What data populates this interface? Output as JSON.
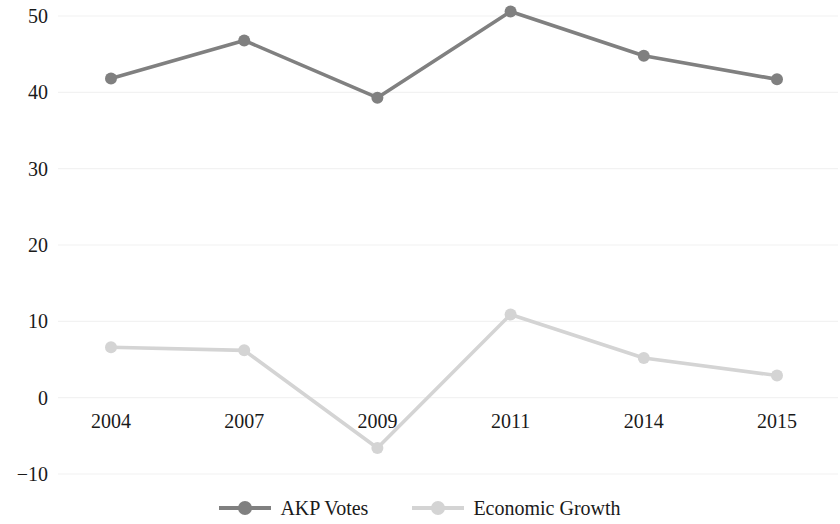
{
  "chart_data": {
    "type": "line",
    "title": "",
    "xlabel": "",
    "ylabel": "",
    "categories": [
      "2004",
      "2007",
      "2009",
      "2011",
      "2014",
      "2015"
    ],
    "series": [
      {
        "name": "AKP Votes",
        "color": "#808080",
        "values": [
          41.8,
          46.8,
          39.3,
          50.6,
          44.8,
          41.7
        ]
      },
      {
        "name": "Economic Growth",
        "color": "#d4d4d4",
        "values": [
          6.6,
          6.2,
          -6.6,
          10.9,
          5.2,
          2.9
        ]
      }
    ],
    "ylim": [
      -10,
      50
    ],
    "yticks": [
      50,
      40,
      30,
      20,
      10,
      0,
      -10
    ],
    "ytick_labels": [
      "50",
      "40",
      "30",
      "20",
      "10",
      "0",
      "−10"
    ],
    "grid": true,
    "grid_axis": "y",
    "grid_color": "#f2f2f2",
    "legend_position": "bottom",
    "marker": "circle",
    "background": "#ffffff"
  },
  "legend": {
    "items": [
      {
        "label": "AKP Votes"
      },
      {
        "label": "Economic Growth"
      }
    ]
  },
  "axis": {
    "y_labels": [
      "50",
      "40",
      "30",
      "20",
      "10",
      "0",
      "−10"
    ],
    "x_labels": [
      "2004",
      "2007",
      "2009",
      "2011",
      "2014",
      "2015"
    ]
  }
}
